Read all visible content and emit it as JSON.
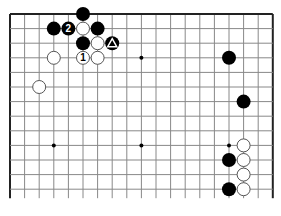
{
  "diagram": {
    "type": "go-board-fragment",
    "grid": {
      "columns": 19,
      "visible_rows": 13,
      "origin_x": 10,
      "origin_y": 14,
      "spacing": 14.6,
      "bottom_open": true,
      "line_color": "#888888",
      "edge_color": "#222222"
    },
    "star_points": [
      {
        "col": 9,
        "row": 3
      },
      {
        "col": 3,
        "row": 9
      },
      {
        "col": 9,
        "row": 9
      },
      {
        "col": 15,
        "row": 9
      }
    ],
    "stones": [
      {
        "color": "black",
        "col": 5,
        "row": 0,
        "label": ""
      },
      {
        "color": "black",
        "col": 3,
        "row": 1,
        "label": ""
      },
      {
        "color": "black",
        "col": 4,
        "row": 1,
        "label": "2"
      },
      {
        "color": "white",
        "col": 5,
        "row": 1,
        "label": ""
      },
      {
        "color": "black",
        "col": 6,
        "row": 1,
        "label": ""
      },
      {
        "color": "black",
        "col": 5,
        "row": 2,
        "label": ""
      },
      {
        "color": "white",
        "col": 6,
        "row": 2,
        "label": ""
      },
      {
        "color": "black",
        "col": 7,
        "row": 2,
        "label": "triangle"
      },
      {
        "color": "white",
        "col": 3,
        "row": 3,
        "label": ""
      },
      {
        "color": "white",
        "col": 5,
        "row": 3,
        "label": "1"
      },
      {
        "color": "white",
        "col": 6,
        "row": 3,
        "label": ""
      },
      {
        "color": "white",
        "col": 2,
        "row": 5,
        "label": ""
      },
      {
        "color": "black",
        "col": 15,
        "row": 3,
        "label": ""
      },
      {
        "color": "black",
        "col": 16,
        "row": 6,
        "label": ""
      },
      {
        "color": "white",
        "col": 16,
        "row": 9,
        "label": ""
      },
      {
        "color": "black",
        "col": 15,
        "row": 10,
        "label": ""
      },
      {
        "color": "white",
        "col": 16,
        "row": 10,
        "label": ""
      },
      {
        "color": "white",
        "col": 16,
        "row": 11,
        "label": ""
      },
      {
        "color": "black",
        "col": 15,
        "row": 12,
        "label": ""
      },
      {
        "color": "white",
        "col": 16,
        "row": 12,
        "label": ""
      }
    ],
    "colors": {
      "black_stone": "#000000",
      "white_stone": "#ffffff",
      "white_stone_border": "#555555",
      "background": "#ffffff"
    }
  }
}
